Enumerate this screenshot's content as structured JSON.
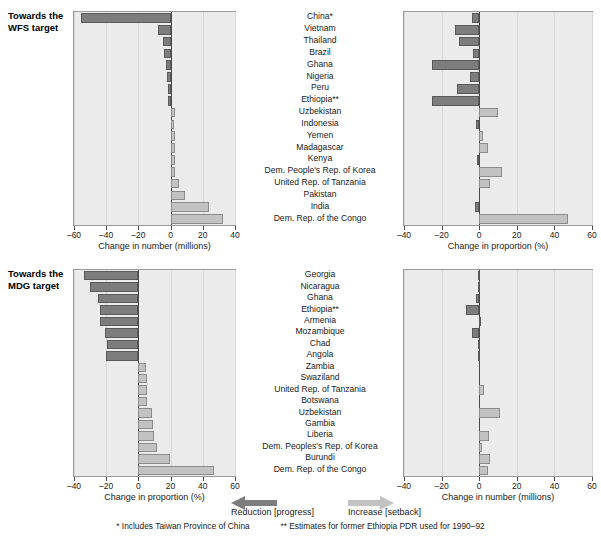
{
  "chart_data": [
    {
      "id": "wfs-number",
      "type": "bar",
      "orientation": "horizontal",
      "title": "Towards the WFS target",
      "xlabel": "Change in number (millions)",
      "ylabel": "",
      "xlim": [
        -60,
        40
      ],
      "xticks": [
        -60,
        -40,
        -20,
        0,
        20,
        40
      ],
      "xticklabels": [
        "–60",
        "–40",
        "–20",
        "0",
        "20",
        "40"
      ],
      "grid": true,
      "legend": "none",
      "categories": [
        "China*",
        "Vietnam",
        "Thailand",
        "Brazil",
        "Ghana",
        "Nigeria",
        "Peru",
        "Ethiopia**",
        "Uzbekistan",
        "Indonesia",
        "Yemen",
        "Madagascar",
        "Kenya",
        "Dem. People's Rep. of Korea",
        "United Rep. of Tanzania",
        "Pakistan",
        "India",
        "Dem. Rep. of the Congo"
      ],
      "values": [
        -55.4,
        -8.0,
        -4.6,
        -4.4,
        -2.6,
        -2.0,
        -1.8,
        -1.9,
        2.7,
        2.4,
        2.5,
        2.6,
        2.6,
        3.0,
        5.5,
        9.2,
        24.0,
        32.3
      ]
    },
    {
      "id": "wfs-proportion",
      "type": "bar",
      "orientation": "horizontal",
      "title": "Towards the WFS target",
      "xlabel": "Change in proportion (%)",
      "ylabel": "",
      "xlim": [
        -40,
        60
      ],
      "xticks": [
        -40,
        -20,
        0,
        20,
        40,
        60
      ],
      "xticklabels": [
        "–40",
        "–20",
        "0",
        "20",
        "40",
        "60"
      ],
      "grid": true,
      "legend": "none",
      "categories": [
        "China*",
        "Vietnam",
        "Thailand",
        "Brazil",
        "Ghana",
        "Nigeria",
        "Peru",
        "Ethiopia**",
        "Uzbekistan",
        "Indonesia",
        "Yemen",
        "Madagascar",
        "Kenya",
        "Dem. People's Rep. of Korea",
        "United Rep. of Tanzania",
        "Pakistan",
        "India",
        "Dem. Rep. of the Congo"
      ],
      "values": [
        -4.0,
        -13.0,
        -11.0,
        -3.5,
        -25.0,
        -5.0,
        -12.0,
        -25.0,
        10.0,
        -1.5,
        2.0,
        4.5,
        -1.0,
        12.0,
        5.5,
        0.0,
        -2.0,
        47.0
      ]
    },
    {
      "id": "mdg-proportion",
      "type": "bar",
      "orientation": "horizontal",
      "title": "Towards the MDG target",
      "xlabel": "Change in proportion (%)",
      "ylabel": "",
      "xlim": [
        -40,
        60
      ],
      "xticks": [
        -40,
        -20,
        0,
        20,
        40,
        60
      ],
      "xticklabels": [
        "–40",
        "–20",
        "0",
        "20",
        "40",
        "60"
      ],
      "grid": true,
      "legend": "none",
      "categories": [
        "Georgia",
        "Nicaragua",
        "Ghana",
        "Ethiopia**",
        "Armenia",
        "Mozambique",
        "Chad",
        "Angola",
        "Zambia",
        "Swaziland",
        "United Rep. of Tanzania",
        "Botswana",
        "Uzbekistan",
        "Gambia",
        "Liberia",
        "Dem. Peoples's Rep. of Korea",
        "Burundi",
        "Dem. Rep. of the Congo"
      ],
      "values": [
        -34.0,
        -30.0,
        -25.0,
        -24.0,
        -24.0,
        -21.0,
        -19.5,
        -20.0,
        4.5,
        5.5,
        5.5,
        5.5,
        8.5,
        9.0,
        9.5,
        11.5,
        19.5,
        47.0
      ]
    },
    {
      "id": "mdg-number",
      "type": "bar",
      "orientation": "horizontal",
      "title": "Towards the MDG target",
      "xlabel": "Change in number (millions)",
      "ylabel": "",
      "xlim": [
        -40,
        60
      ],
      "xticks": [
        -40,
        -20,
        0,
        20,
        40,
        60
      ],
      "xticklabels": [
        "–40",
        "–20",
        "0",
        "20",
        "40",
        "60"
      ],
      "grid": true,
      "legend": "none",
      "categories": [
        "Georgia",
        "Nicaragua",
        "Ghana",
        "Ethiopia**",
        "Armenia",
        "Mozambique",
        "Chad",
        "Angola",
        "Zambia",
        "Swaziland",
        "United Rep. of Tanzania",
        "Botswana",
        "Uzbekistan",
        "Gambia",
        "Liberia",
        "Dem. Peoples's Rep. of Korea",
        "Burundi",
        "Dem. Rep. of the Congo"
      ],
      "values": [
        -0.4,
        -0.5,
        -1.9,
        -7.0,
        -0.3,
        -4.0,
        -0.5,
        -0.6,
        0.0,
        0.0,
        2.4,
        0.0,
        11.0,
        0.0,
        5.0,
        1.5,
        6.0,
        4.5
      ]
    }
  ],
  "panels": {
    "top": {
      "side_label_line1": "Towards the",
      "side_label_line2": "WFS target",
      "left_chart": 0,
      "right_chart": 1
    },
    "bottom": {
      "side_label_line1": "Towards the",
      "side_label_line2": "MDG target",
      "left_chart": 2,
      "right_chart": 3
    }
  },
  "legend": {
    "reduction_label": "Reduction [progress]",
    "increase_label": "Increase [setback]",
    "reduction_color": "#7d7d7d",
    "increase_color": "#c2c2c2"
  },
  "footnotes": {
    "note1": "* Includes Taiwan Province of China",
    "note2": "** Estimates for former Ethiopia PDR used for 1990–92"
  }
}
